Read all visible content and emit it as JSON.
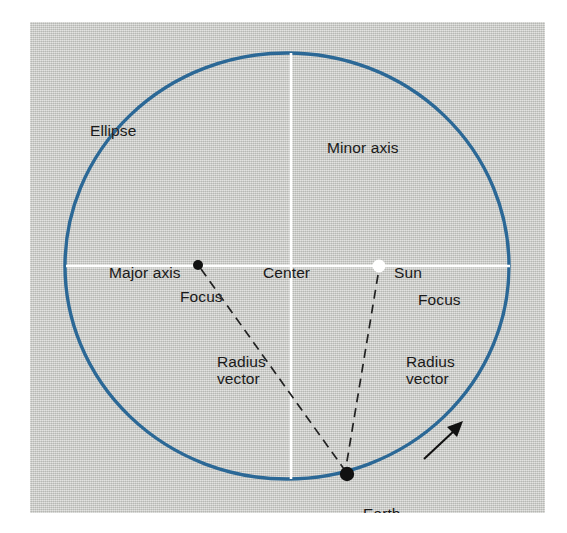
{
  "figure": {
    "kind": "diagram",
    "colors": {
      "panel_background": "#c9cac6",
      "page_background": "#ffffff",
      "ellipse_stroke": "#2b6896",
      "axis_line": "#ffffff",
      "label_text": "#1a1a1a",
      "focus_dot": "#111111",
      "sun_dot": "#ffffff",
      "earth_dot": "#111111",
      "radius_vector_dash": "#222222",
      "direction_arrow": "#111111"
    }
  },
  "labels": {
    "ellipse": "Ellipse",
    "minor_axis": "Minor axis",
    "major_axis": "Major axis",
    "center": "Center",
    "sun": "Sun",
    "focus_left": "Focus",
    "focus_right": "Focus",
    "radius_vector_left": "Radius\nvector",
    "radius_vector_right": "Radius\nvector",
    "earth": "Earth"
  },
  "icons": {
    "left_focus": "focus-point-icon",
    "right_focus_sun": "sun-point-icon",
    "earth": "earth-point-icon",
    "direction": "orbit-direction-arrow-icon"
  },
  "geometry": {
    "ellipse": {
      "cx": 287,
      "cy": 266,
      "rx": 222,
      "ry": 213,
      "stroke_width": 3.4
    },
    "minor_axis_line": {
      "x": 291,
      "y1": 53,
      "y2": 479
    },
    "major_axis_line": {
      "y": 266,
      "x1": 66,
      "x2": 510
    },
    "left_focus_point": {
      "x": 198,
      "y": 265,
      "r": 5
    },
    "sun_point": {
      "x": 379,
      "y": 266,
      "r": 6.5
    },
    "earth_point": {
      "x": 347,
      "y": 474,
      "r": 7
    },
    "radius_vector_left": {
      "x1": 200,
      "y1": 268,
      "x2": 344,
      "y2": 470
    },
    "radius_vector_right": {
      "x1": 378,
      "y1": 275,
      "x2": 346,
      "y2": 468
    },
    "direction_arrow": {
      "x1": 424,
      "y1": 459,
      "x2": 461,
      "y2": 424
    }
  }
}
